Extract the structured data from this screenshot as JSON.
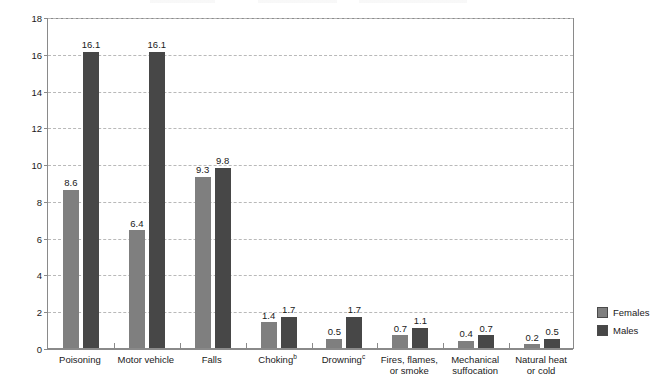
{
  "chart_data": {
    "type": "bar",
    "title": "",
    "xlabel": "",
    "ylabel": "Deaths per 100,000 population",
    "ylim": [
      0,
      18
    ],
    "ytick_step": 2,
    "yticks": [
      "0",
      "2",
      "4",
      "6",
      "8",
      "10",
      "12",
      "14",
      "16",
      "18"
    ],
    "grid": true,
    "legend_position": "right",
    "categories": [
      "Poisoning",
      "Motor vehicle",
      "Falls",
      "Choking",
      "Drowning",
      "Fires, flames, or smoke",
      "Mechanical suffocation",
      "Natural heat or cold"
    ],
    "category_labels": [
      {
        "line1": "Poisoning",
        "line2": "",
        "sup": ""
      },
      {
        "line1": "Motor vehicle",
        "line2": "",
        "sup": ""
      },
      {
        "line1": "Falls",
        "line2": "",
        "sup": ""
      },
      {
        "line1": "Choking",
        "line2": "",
        "sup": "b"
      },
      {
        "line1": "Drowning",
        "line2": "",
        "sup": "c"
      },
      {
        "line1": "Fires, flames,",
        "line2": "or smoke",
        "sup": ""
      },
      {
        "line1": "Mechanical",
        "line2": "suffocation",
        "sup": ""
      },
      {
        "line1": "Natural heat",
        "line2": "or cold",
        "sup": ""
      }
    ],
    "series": [
      {
        "name": "Females",
        "color": "#7f7f7f",
        "values": [
          8.6,
          6.4,
          9.3,
          1.4,
          0.5,
          0.7,
          0.4,
          0.2
        ],
        "labels": [
          "8.6",
          "6.4",
          "9.3",
          "1.4",
          "0.5",
          "0.7",
          "0.4",
          "0.2"
        ]
      },
      {
        "name": "Males",
        "color": "#474747",
        "values": [
          16.1,
          16.1,
          9.8,
          1.7,
          1.7,
          1.1,
          0.7,
          0.5
        ],
        "labels": [
          "16.1",
          "16.1",
          "9.8",
          "1.7",
          "1.7",
          "1.1",
          "0.7",
          "0.5"
        ]
      }
    ]
  },
  "legend": {
    "items": [
      {
        "label": "Females",
        "color": "#7f7f7f"
      },
      {
        "label": "Males",
        "color": "#474747"
      }
    ]
  }
}
